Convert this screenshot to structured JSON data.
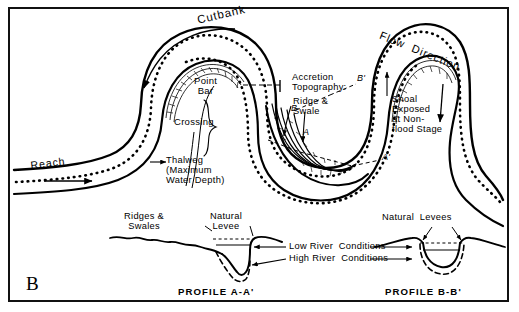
{
  "figure": {
    "letter": "B",
    "caption_hidden": ""
  },
  "map_labels": {
    "cutbank": "Cutbank",
    "point_bar": "Point\nBar",
    "crossing": "Crossing",
    "thalweg": "Thalweg\n(Maximum\nWater Depth)",
    "reach": "Reach",
    "accretion_topography": "Accretion\nTopography:",
    "ridge_and_swale": "Ridge &\nSwale",
    "flow_direction": "Flow  Direction",
    "shoal": "Shoal\nExposed\nat Non-\nflood Stage",
    "section_a_start": "A",
    "section_a_end": "A'",
    "section_b_start": "B",
    "section_b_end": "B'"
  },
  "profiles": {
    "left": {
      "title": "PROFILE  A-A'",
      "ridges_swales": "Ridges &\nSwales",
      "natural_levee": "Natural\nLevee"
    },
    "right": {
      "title": "PROFILE  B-B'",
      "natural_levees": "Natural  Levees"
    },
    "legend": {
      "low_river": "Low River  Conditions",
      "high_river": "High River  Conditions"
    }
  },
  "style": {
    "ink": "#000000",
    "paper": "#ffffff",
    "frame": "#111111"
  }
}
